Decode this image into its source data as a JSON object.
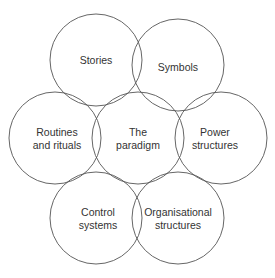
{
  "diagram": {
    "stroke_color": "#555555",
    "text_color": "#333333",
    "circles": [
      {
        "id": "stories",
        "cx": 96,
        "cy": 60,
        "r": 46,
        "lines": [
          "Stories"
        ]
      },
      {
        "id": "symbols",
        "cx": 178,
        "cy": 65,
        "r": 46,
        "lines": [
          "Symbols"
        ]
      },
      {
        "id": "routines",
        "cx": 55,
        "cy": 138,
        "r": 46,
        "lines": [
          "Routines",
          "and rituals"
        ]
      },
      {
        "id": "paradigm",
        "cx": 138,
        "cy": 138,
        "r": 46,
        "lines": [
          "The",
          "paradigm"
        ]
      },
      {
        "id": "power",
        "cx": 221,
        "cy": 138,
        "r": 46,
        "lines": [
          "Power",
          "structures"
        ]
      },
      {
        "id": "control",
        "cx": 96,
        "cy": 218,
        "r": 46,
        "lines": [
          "Control",
          "systems"
        ]
      },
      {
        "id": "organisational",
        "cx": 178,
        "cy": 218,
        "r": 46,
        "lines": [
          "Organisational",
          "structures"
        ]
      }
    ]
  }
}
